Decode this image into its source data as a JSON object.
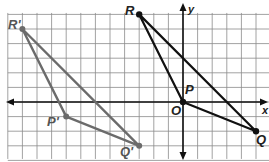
{
  "figure": {
    "grid": {
      "origin_px": [
        183,
        102
      ],
      "unit_px": 14.6,
      "x_range": [
        -12,
        6
      ],
      "y_range": [
        -4,
        6
      ]
    },
    "axes": {
      "x_label": "x",
      "y_label": "y",
      "origin_label": "O"
    },
    "original_triangle": {
      "color": "#111111",
      "vertices": [
        {
          "name": "P",
          "coords": [
            0,
            0
          ]
        },
        {
          "name": "Q",
          "coords": [
            5,
            -2
          ]
        },
        {
          "name": "R",
          "coords": [
            -3,
            6
          ]
        }
      ]
    },
    "image_triangle": {
      "color": "#6b6b6b",
      "vertices": [
        {
          "name": "P'",
          "coords": [
            -8,
            -1
          ]
        },
        {
          "name": "Q'",
          "coords": [
            -3,
            -3
          ]
        },
        {
          "name": "R'",
          "coords": [
            -11,
            5
          ]
        }
      ]
    },
    "labels": {
      "P": "P",
      "Q": "Q",
      "R": "R",
      "P_prime": "P'",
      "Q_prime": "Q'",
      "R_prime": "R'",
      "O": "O",
      "x": "x",
      "y": "y"
    }
  }
}
